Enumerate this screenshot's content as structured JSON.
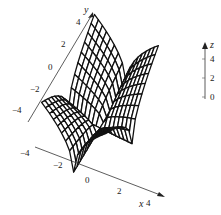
{
  "chart_data": {
    "type": "surface",
    "title": "",
    "x_axis": {
      "label": "x",
      "range": [
        -4,
        4
      ],
      "ticks": [
        -4,
        -2,
        0,
        2,
        4
      ],
      "tick_labels": [
        "−4",
        "−2",
        "0",
        "2",
        "4"
      ]
    },
    "y_axis": {
      "label": "y",
      "range": [
        -4,
        4
      ],
      "ticks": [
        -4,
        -2,
        0,
        2,
        4
      ],
      "tick_labels": [
        "−4",
        "−2",
        "0",
        "2",
        "4"
      ]
    },
    "z_axis": {
      "label": "z",
      "range": [
        0,
        4
      ],
      "ticks": [
        0,
        2,
        4
      ],
      "tick_labels": [
        "0",
        "2",
        "4"
      ]
    },
    "grid_divisions": 16,
    "surface": "z = sqrt(|x*y|)",
    "line_color": "#111111",
    "fill_color": "#ffffff"
  }
}
